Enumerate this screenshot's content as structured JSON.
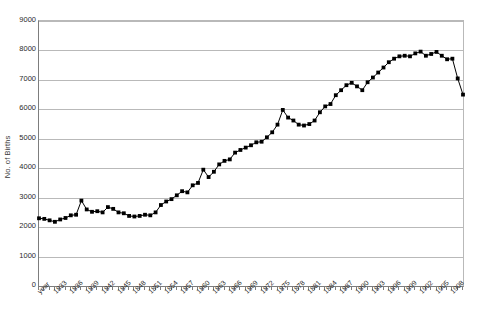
{
  "chart_data": {
    "type": "line",
    "title": "",
    "xlabel": "",
    "ylabel": "No. of Births",
    "ylim": [
      0,
      9000
    ],
    "y_tick_values": [
      9000,
      8000,
      7000,
      6000,
      5000,
      4000,
      3000,
      2000,
      1000,
      0
    ],
    "y_tick_labels": [
      "9000",
      "8000",
      "7000",
      "6000",
      "5000",
      "4000",
      "3000",
      "2000",
      "1000",
      "0"
    ],
    "grid": true,
    "legend": "none",
    "marker": "filled-square",
    "series_color": "#000000",
    "x_first_label": "year",
    "x_tick_label_interval": 3,
    "x_tick_labels": [
      "year",
      "1833",
      "1836",
      "1839",
      "1842",
      "1845",
      "1848",
      "1851",
      "1854",
      "1857",
      "1860",
      "1863",
      "1866",
      "1869",
      "1872",
      "1875",
      "1878",
      "1881",
      "1884",
      "1887",
      "1890",
      "1893",
      "1896",
      "1899",
      "1902",
      "1905",
      "1908"
    ],
    "x": [
      1830,
      1831,
      1832,
      1833,
      1834,
      1835,
      1836,
      1837,
      1838,
      1839,
      1840,
      1841,
      1842,
      1843,
      1844,
      1845,
      1846,
      1847,
      1848,
      1849,
      1850,
      1851,
      1852,
      1853,
      1854,
      1855,
      1856,
      1857,
      1858,
      1859,
      1860,
      1861,
      1862,
      1863,
      1864,
      1865,
      1866,
      1867,
      1868,
      1869,
      1870,
      1871,
      1872,
      1873,
      1874,
      1875,
      1876,
      1877,
      1878,
      1879,
      1880,
      1881,
      1882,
      1883,
      1884,
      1885,
      1886,
      1887,
      1888,
      1889,
      1890,
      1891,
      1892,
      1893,
      1894,
      1895,
      1896,
      1897,
      1898,
      1899,
      1900,
      1901,
      1902,
      1903,
      1904,
      1905,
      1906,
      1907,
      1908,
      1909,
      1910
    ],
    "values": [
      2300,
      2280,
      2230,
      2180,
      2260,
      2310,
      2400,
      2420,
      2900,
      2600,
      2520,
      2540,
      2500,
      2680,
      2620,
      2500,
      2470,
      2380,
      2360,
      2380,
      2420,
      2400,
      2500,
      2750,
      2870,
      2950,
      3080,
      3220,
      3180,
      3420,
      3500,
      3950,
      3700,
      3880,
      4130,
      4250,
      4300,
      4530,
      4620,
      4700,
      4780,
      4880,
      4900,
      5050,
      5220,
      5480,
      5980,
      5720,
      5620,
      5480,
      5450,
      5500,
      5620,
      5900,
      6100,
      6180,
      6480,
      6650,
      6820,
      6900,
      6780,
      6650,
      6920,
      7080,
      7250,
      7420,
      7600,
      7720,
      7800,
      7820,
      7800,
      7900,
      7960,
      7820,
      7880,
      7950,
      7820,
      7700,
      7720,
      7050,
      6500
    ],
    "x_tick_count": 81,
    "annotations": []
  },
  "axis": {
    "y_title": "No. of Births"
  }
}
